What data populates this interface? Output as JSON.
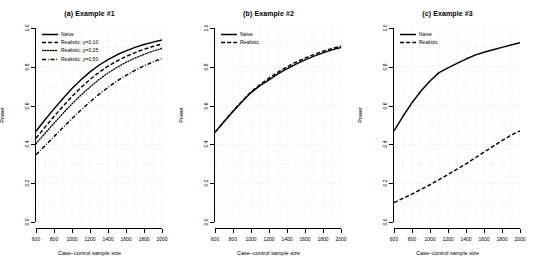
{
  "figure": {
    "width": 537,
    "height": 278,
    "background": "#ffffff",
    "line_color": "#000000",
    "grid_color": "#d9d9d9"
  },
  "axis": {
    "xlabel": "Case–control sample size",
    "ylabel": "Power",
    "xticks": [
      600,
      800,
      1000,
      1200,
      1400,
      1600,
      1800,
      2000
    ],
    "xtick_labels": [
      "600",
      "800",
      "1000",
      "1200",
      "1400",
      "1600",
      "1800",
      "2000"
    ],
    "yticks": [
      0.0,
      0.2,
      0.4,
      0.6,
      0.8,
      1.0
    ],
    "ytick_labels": [
      "0.0",
      "0.2",
      "0.4",
      "0.6",
      "0.8",
      "1.0"
    ],
    "xlim": [
      600,
      2000
    ],
    "ylim": [
      0.0,
      1.0
    ]
  },
  "panels": [
    {
      "key": "a",
      "title": "(a) Example #1",
      "legend": [
        {
          "label": "Naive",
          "style": "solid"
        },
        {
          "label": "Realistic: ρ=0.10",
          "style": "dashed"
        },
        {
          "label": "Realistic: ρ=0.25",
          "style": "dotted"
        },
        {
          "label": "Realistic: ρ=0.50",
          "style": "dashdot"
        }
      ]
    },
    {
      "key": "b",
      "title": "(b) Example #2",
      "legend": [
        {
          "label": "Naive",
          "style": "solid"
        },
        {
          "label": "Realistic",
          "style": "dashed"
        }
      ]
    },
    {
      "key": "c",
      "title": "(c) Example #3",
      "legend": [
        {
          "label": "Naive",
          "style": "solid"
        },
        {
          "label": "Realistic",
          "style": "dashed"
        }
      ]
    }
  ],
  "chart_data": [
    {
      "type": "line",
      "panel": "a",
      "title": "(a) Example #1",
      "xlabel": "Case–control sample size",
      "ylabel": "Power",
      "xlim": [
        600,
        2000
      ],
      "ylim": [
        0.0,
        1.0
      ],
      "grid": true,
      "legend_position": "top-left",
      "x": [
        600,
        700,
        800,
        900,
        1000,
        1100,
        1200,
        1300,
        1400,
        1500,
        1600,
        1700,
        1800,
        1900,
        2000
      ],
      "series": [
        {
          "name": "Naive",
          "style": "solid",
          "values": [
            0.468,
            0.527,
            0.583,
            0.637,
            0.688,
            0.733,
            0.774,
            0.808,
            0.837,
            0.862,
            0.882,
            0.9,
            0.915,
            0.927,
            0.938
          ]
        },
        {
          "name": "Realistic: ρ=0.10",
          "style": "dashed",
          "values": [
            0.432,
            0.489,
            0.544,
            0.597,
            0.647,
            0.693,
            0.735,
            0.771,
            0.803,
            0.83,
            0.853,
            0.873,
            0.89,
            0.905,
            0.917
          ]
        },
        {
          "name": "Realistic: ρ=0.25",
          "style": "dotted",
          "values": [
            0.404,
            0.457,
            0.509,
            0.56,
            0.609,
            0.654,
            0.696,
            0.734,
            0.768,
            0.797,
            0.823,
            0.845,
            0.864,
            0.881,
            0.895
          ]
        },
        {
          "name": "Realistic: ρ=0.50",
          "style": "dashdot",
          "values": [
            0.347,
            0.393,
            0.44,
            0.487,
            0.533,
            0.577,
            0.619,
            0.658,
            0.694,
            0.727,
            0.756,
            0.782,
            0.805,
            0.825,
            0.843
          ]
        }
      ]
    },
    {
      "type": "line",
      "panel": "b",
      "title": "(b) Example #2",
      "xlabel": "Case–control sample size",
      "ylabel": "Power",
      "xlim": [
        600,
        2000
      ],
      "ylim": [
        0.0,
        1.0
      ],
      "grid": true,
      "legend_position": "top-left",
      "x": [
        600,
        700,
        800,
        900,
        1000,
        1100,
        1200,
        1300,
        1400,
        1500,
        1600,
        1700,
        1800,
        1900,
        2000
      ],
      "series": [
        {
          "name": "Naive",
          "style": "solid",
          "values": [
            0.462,
            0.517,
            0.57,
            0.62,
            0.667,
            0.703,
            0.733,
            0.763,
            0.79,
            0.814,
            0.836,
            0.855,
            0.872,
            0.887,
            0.9
          ]
        },
        {
          "name": "Realistic",
          "style": "dashed",
          "values": [
            0.462,
            0.518,
            0.572,
            0.623,
            0.67,
            0.709,
            0.742,
            0.773,
            0.8,
            0.824,
            0.845,
            0.864,
            0.88,
            0.894,
            0.906
          ]
        }
      ]
    },
    {
      "type": "line",
      "panel": "c",
      "title": "(c) Example #3",
      "xlabel": "Case–control sample size",
      "ylabel": "Power",
      "xlim": [
        600,
        2000
      ],
      "ylim": [
        0.0,
        1.0
      ],
      "grid": true,
      "legend_position": "top-left",
      "x": [
        600,
        700,
        800,
        900,
        1000,
        1100,
        1200,
        1300,
        1400,
        1500,
        1600,
        1700,
        1800,
        1900,
        2000
      ],
      "series": [
        {
          "name": "Naive",
          "style": "solid",
          "values": [
            0.47,
            0.545,
            0.615,
            0.675,
            0.727,
            0.77,
            0.794,
            0.818,
            0.84,
            0.86,
            0.875,
            0.888,
            0.9,
            0.912,
            0.924
          ]
        },
        {
          "name": "Realistic",
          "style": "dashed",
          "values": [
            0.1,
            0.122,
            0.144,
            0.168,
            0.192,
            0.218,
            0.245,
            0.272,
            0.3,
            0.33,
            0.36,
            0.39,
            0.42,
            0.447,
            0.47
          ]
        }
      ]
    }
  ]
}
